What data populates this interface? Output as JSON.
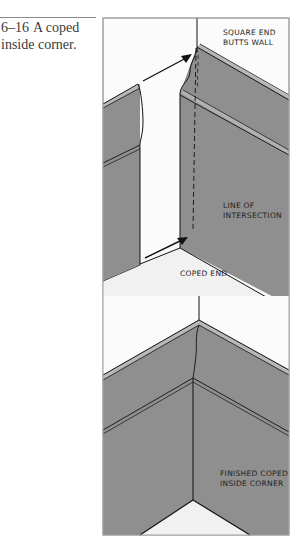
{
  "caption": {
    "number": "6–16",
    "text_line1": "A coped",
    "text_line2": "inside corner."
  },
  "figure": {
    "labels": {
      "square_end_1": "SQUARE END",
      "square_end_2": "BUTTS WALL",
      "line_of_1": "LINE OF",
      "line_of_2": "INTERSECTION",
      "coped_end": "COPED END",
      "finished_1": "FINISHED COPED",
      "finished_2": "INSIDE CORNER"
    },
    "colors": {
      "moulding_gray": "#8f8f8f",
      "floor_white": "#f3f3f3",
      "frame": "#9a9a9a",
      "ink": "#111111"
    }
  }
}
